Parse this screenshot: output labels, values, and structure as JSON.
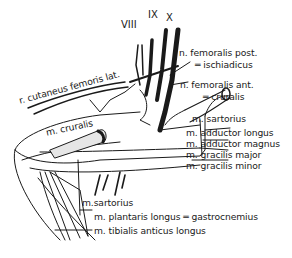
{
  "diagram": {
    "nerve_roots": [
      "VIII",
      "IX",
      "X"
    ],
    "labels": {
      "cutaneus": "r. cutaneus femoris lat.",
      "femoralis_post": "n. femoralis post.",
      "ischiadicus": "═ ischiadicus",
      "femoralis_ant": "n. femoralis ant.",
      "cruralis_nerve": "═ cruralis",
      "cruralis_muscle": "m. cruralis",
      "sartorius_upper": "m. sartorius",
      "adductor_longus": "m. adductor longus",
      "adductor_magnus": "m. adductor magnus",
      "gracilis_major": "m. gracilis major",
      "gracilis_minor": "m. gracilis minor",
      "sartorius_lower": "m.sartorius",
      "plantaris": "m. plantaris longus ═ gastrocnemius",
      "tibialis": "m. tibialis anticus longus"
    },
    "colors": {
      "ink": "#1a1a1a",
      "background": "#ffffff"
    }
  }
}
